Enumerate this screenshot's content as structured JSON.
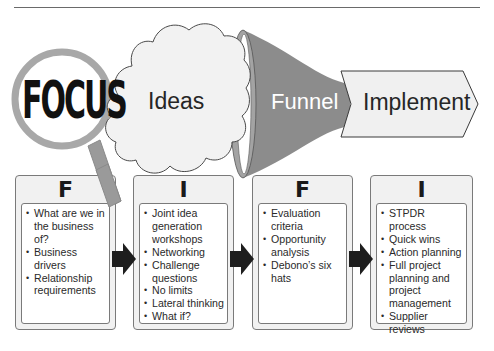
{
  "header": {
    "rule": true
  },
  "top_row": {
    "focus": {
      "text": "FOCUS",
      "icon": "magnifying-glass"
    },
    "ideas": {
      "text": "Ideas",
      "shape": "cloud"
    },
    "funnel": {
      "text": "Funnel",
      "shape": "funnel"
    },
    "implement": {
      "text": "Implement",
      "shape": "chevron"
    }
  },
  "stages": [
    {
      "letter": "F",
      "items": [
        "What are we in the business of?",
        "Business drivers",
        "Relationship requirements"
      ]
    },
    {
      "letter": "I",
      "items": [
        "Joint idea generation workshops",
        "Networking",
        "Challenge questions",
        "No limits",
        "Lateral thinking",
        "What if?"
      ]
    },
    {
      "letter": "F",
      "items": [
        "Evaluation criteria",
        "Opportunity analysis",
        "Debono’s six hats"
      ]
    },
    {
      "letter": "I",
      "items": [
        "STPDR process",
        "Quick wins",
        "Action planning",
        "Full project planning and project management",
        "Supplier reviews"
      ]
    }
  ],
  "colors": {
    "funnel_fill": "#8c8c8c",
    "cloud_fill": "#f2f2f2",
    "chevron_fill": "#f0f0f0",
    "lens_ring": "#a8a8a8",
    "arrow_fill": "#1e1e1e"
  }
}
